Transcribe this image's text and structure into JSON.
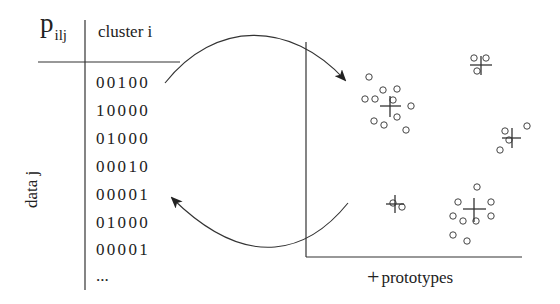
{
  "table": {
    "corner_label": "p",
    "corner_subscript": "ilj",
    "column_header": "cluster i",
    "row_header": "data j",
    "rows": [
      "00100",
      "10000",
      "01000",
      "00010",
      "00001",
      "01000",
      "00001"
    ],
    "ellipsis": "..."
  },
  "plot": {
    "legend_symbol": "+",
    "legend_label": "prototypes",
    "clusters": [
      {
        "name": "top-left",
        "prototype": [
          390,
          106
        ],
        "points": [
          [
            369,
            77
          ],
          [
            383,
            90
          ],
          [
            397,
            89
          ],
          [
            365,
            99
          ],
          [
            375,
            99
          ],
          [
            397,
            105
          ],
          [
            411,
            106
          ],
          [
            397,
            117
          ],
          [
            374,
            120
          ],
          [
            384,
            124
          ],
          [
            408,
            128
          ]
        ]
      },
      {
        "name": "top-right",
        "prototype": [
          481,
          65
        ],
        "points": [
          [
            474,
            58
          ],
          [
            486,
            58
          ],
          [
            478,
            71
          ]
        ]
      },
      {
        "name": "right",
        "prototype": [
          512,
          138
        ],
        "points": [
          [
            505,
            131
          ],
          [
            509,
            140
          ],
          [
            500,
            150
          ],
          [
            527,
            128
          ]
        ]
      },
      {
        "name": "bottom-left",
        "prototype": [
          395,
          204
        ],
        "points": [
          [
            394,
            204
          ],
          [
            402,
            207
          ]
        ]
      },
      {
        "name": "bottom-right",
        "prototype": [
          474,
          210
        ],
        "points": [
          [
            476,
            187
          ],
          [
            457,
            203
          ],
          [
            491,
            202
          ],
          [
            453,
            216
          ],
          [
            462,
            220
          ],
          [
            476,
            220
          ],
          [
            491,
            216
          ],
          [
            453,
            234
          ],
          [
            467,
            240
          ]
        ]
      }
    ]
  },
  "arrows": {
    "forward": {
      "from_row": "00100",
      "to": "top-left cluster"
    },
    "backward": {
      "from": "bottom-left cluster",
      "to_row": "00001"
    }
  },
  "colors": {
    "line": "#333333",
    "text": "#222222",
    "background": "#ffffff"
  }
}
